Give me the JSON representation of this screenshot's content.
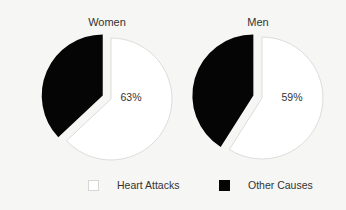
{
  "chart_data": [
    {
      "type": "pie",
      "title": "Women",
      "categories": [
        "Heart Attacks",
        "Other Causes"
      ],
      "values": [
        63,
        37
      ],
      "data_labels": [
        "63%",
        ""
      ],
      "exploded": true
    },
    {
      "type": "pie",
      "title": "Men",
      "categories": [
        "Heart Attacks",
        "Other Causes"
      ],
      "values": [
        59,
        41
      ],
      "data_labels": [
        "59%",
        ""
      ],
      "exploded": true
    }
  ],
  "pies": {
    "women": {
      "title": "Women",
      "label": "63%"
    },
    "men": {
      "title": "Men",
      "label": "59%"
    }
  },
  "legend": {
    "position": "bottom",
    "items": [
      {
        "label": "Heart Attacks",
        "color": "#ffffff"
      },
      {
        "label": "Other Causes",
        "color": "#050505"
      }
    ]
  }
}
